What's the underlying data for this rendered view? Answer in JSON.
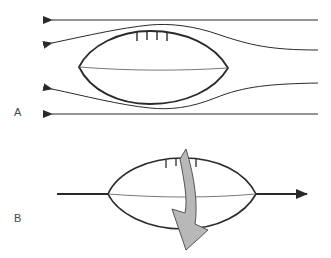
{
  "diagram": {
    "panels": [
      {
        "id": "A",
        "label": "A",
        "description": "Airflow streamlines around a football"
      },
      {
        "id": "B",
        "label": "B",
        "description": "Football travelling with spin axis along direction of motion"
      }
    ],
    "colors": {
      "line": "#2a2a2a",
      "spin_arrow_fill": "#b8b8b8",
      "spin_arrow_stroke": "#555555"
    }
  }
}
